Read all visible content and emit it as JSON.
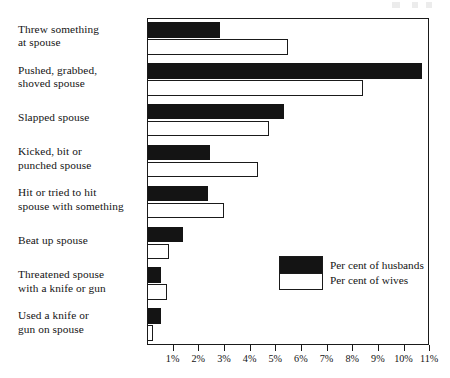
{
  "chart_data": {
    "type": "bar",
    "orientation": "horizontal",
    "title": "",
    "xlabel": "",
    "ylabel": "",
    "xlim": [
      0,
      11
    ],
    "grid": false,
    "legend_position": "inside-right",
    "categories": [
      "Threw something\nat spouse",
      "Pushed, grabbed,\nshoved spouse",
      "Slapped spouse",
      "Kicked, bit or\npunched spouse",
      "Hit or tried to hit\nspouse with something",
      "Beat up spouse",
      "Threatened spouse\nwith a knife or gun",
      "Used a knife or\ngun on spouse"
    ],
    "series": [
      {
        "name": "Per cent of husbands",
        "color": "#141414",
        "values": [
          2.8,
          10.7,
          5.3,
          2.4,
          2.35,
          1.35,
          0.5,
          0.5
        ]
      },
      {
        "name": "Per cent of wives",
        "color": "#ffffff",
        "values": [
          5.45,
          8.4,
          4.7,
          4.3,
          2.95,
          0.8,
          0.75,
          0.2
        ]
      }
    ],
    "xticks": [
      1,
      2,
      3,
      4,
      5,
      6,
      7,
      8,
      9,
      10,
      11
    ],
    "xticklabels": [
      "1%",
      "2%",
      "3%",
      "4%",
      "5%",
      "6%",
      "7%",
      "8%",
      "9%",
      "10%",
      "11%"
    ]
  },
  "legend": {
    "husbands_label": "Per cent of husbands",
    "wives_label": "Per cent of wives"
  },
  "colors": {
    "husbands": "#141414",
    "wives": "#ffffff",
    "frame": "#1a1a1a",
    "background": "#ffffff"
  }
}
